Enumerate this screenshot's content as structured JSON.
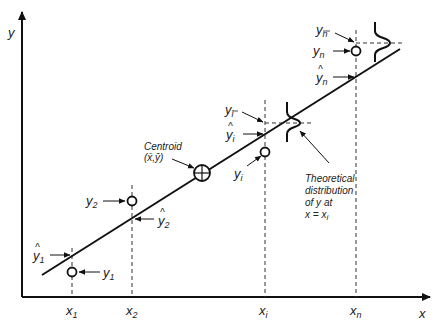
{
  "diagram": {
    "type": "linear-regression-illustration",
    "axes": {
      "x_label": "x",
      "y_label": "y"
    },
    "x_ticks": [
      {
        "base": "x",
        "sub": "1"
      },
      {
        "base": "x",
        "sub": "2"
      },
      {
        "base": "x",
        "sub": "i"
      },
      {
        "base": "x",
        "sub": "n"
      }
    ],
    "observations": {
      "y1": {
        "base": "y",
        "sub": "1"
      },
      "y2": {
        "base": "y",
        "sub": "2"
      },
      "yi": {
        "base": "y",
        "sub": "i"
      },
      "yn": {
        "base": "y",
        "sub": "n"
      }
    },
    "fitted": {
      "y1hat": {
        "hat": "^",
        "base": "y",
        "sub": "1"
      },
      "y2hat": {
        "hat": "^",
        "base": "y",
        "sub": "2"
      },
      "yihat": {
        "hat": "^",
        "base": "y",
        "sub": "i"
      },
      "ynhat": {
        "hat": "^",
        "base": "y",
        "sub": "n"
      }
    },
    "means": {
      "yibar": {
        "base": "y",
        "sub": "i",
        "bar": "¯"
      },
      "ynbar": {
        "base": "y",
        "sub": "n",
        "bar": "¯"
      }
    },
    "centroid": {
      "label": "Centroid",
      "coords": "(x̄,ȳ)"
    },
    "annotation": {
      "lines": [
        "Theoretical",
        "distribution",
        "of y at",
        "x = x"
      ],
      "sub": "i"
    },
    "colors": {
      "ink": "#111111",
      "dash": "#333333",
      "text": "#222222"
    }
  }
}
